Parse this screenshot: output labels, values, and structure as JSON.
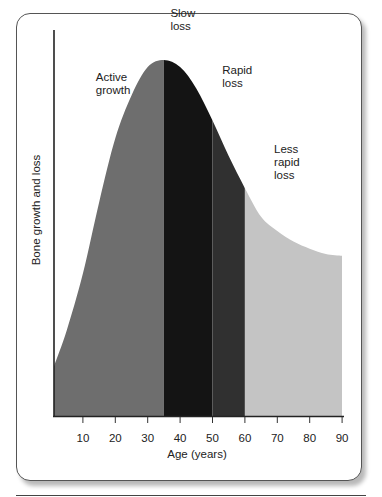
{
  "chart_data": {
    "type": "area",
    "title": "",
    "xlabel": "Age (years)",
    "ylabel": "Bone growth and loss",
    "xlim": [
      0,
      90
    ],
    "ylim": [
      0,
      100
    ],
    "xticks": [
      10,
      20,
      30,
      40,
      50,
      60,
      70,
      80,
      90
    ],
    "grid": false,
    "curve": {
      "x": [
        0,
        5,
        10,
        15,
        20,
        25,
        30,
        35,
        40,
        45,
        50,
        55,
        60,
        65,
        70,
        75,
        80,
        85,
        90
      ],
      "y": [
        14,
        24,
        40,
        60,
        78,
        90,
        98,
        100,
        98,
        92,
        83,
        73,
        64,
        56,
        52,
        49,
        47,
        45.5,
        45
      ]
    },
    "regions": [
      {
        "name": "Active growth",
        "from": 0,
        "to": 35,
        "color": "#6e6e6e"
      },
      {
        "name": "Slow loss",
        "from": 35,
        "to": 50,
        "color": "#141414"
      },
      {
        "name": "Rapid loss",
        "from": 50,
        "to": 60,
        "color": "#303030"
      },
      {
        "name": "Less rapid loss",
        "from": 60,
        "to": 90,
        "color": "#c4c4c4"
      }
    ],
    "annotations": [
      {
        "lines": [
          "Active",
          "growth"
        ],
        "x": 14,
        "y": 94
      },
      {
        "lines": [
          "Slow",
          "loss"
        ],
        "x": 37,
        "y": 112
      },
      {
        "lines": [
          "Rapid",
          "loss"
        ],
        "x": 53,
        "y": 96
      },
      {
        "lines": [
          "Less",
          "rapid",
          "loss"
        ],
        "x": 69,
        "y": 74
      }
    ]
  }
}
